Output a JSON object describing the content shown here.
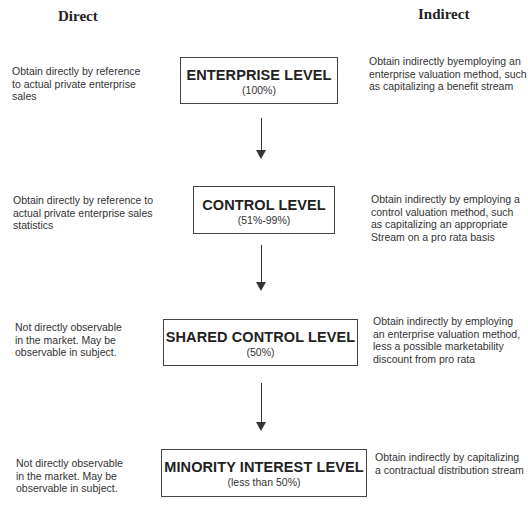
{
  "headers": {
    "direct": "Direct",
    "indirect": "Indirect"
  },
  "levels": [
    {
      "title": "ENTERPRISE LEVEL",
      "pct": "(100%)",
      "direct": [
        "Obtain directly by reference",
        "to actual private enterprise",
        "sales"
      ],
      "indirect": [
        "Obtain indirectly byemploying an",
        "enterprise valuation method, such",
        "as capitalizing a benefit stream"
      ]
    },
    {
      "title": "CONTROL LEVEL",
      "pct": "(51%-99%)",
      "direct": [
        "Obtain directly by reference to",
        "actual private enterprise sales",
        "statistics"
      ],
      "indirect": [
        "Obtain indirectly by employing a",
        "control valuation method, such",
        "as capitalizing an appropriate",
        "Stream on a pro rata basis"
      ]
    },
    {
      "title": "SHARED CONTROL LEVEL",
      "pct": "(50%)",
      "direct": [
        "Not directly observable",
        "in the market. May be",
        "observable in subject."
      ],
      "indirect": [
        "Obtain indirectly by employing",
        "an enterprise valuation method,",
        "less a possible marketability",
        "discount from pro rata"
      ]
    },
    {
      "title": "MINORITY INTEREST LEVEL",
      "pct": "(less than 50%)",
      "direct": [
        "Not directly observable",
        "in the market. May be",
        "observable in  subject."
      ],
      "indirect": [
        "Obtain indirectly by capitalizing",
        "a contractual distribution stream"
      ]
    }
  ],
  "colors": {
    "text": "#2a2a2a",
    "border": "#444444",
    "background": "#ffffff"
  }
}
